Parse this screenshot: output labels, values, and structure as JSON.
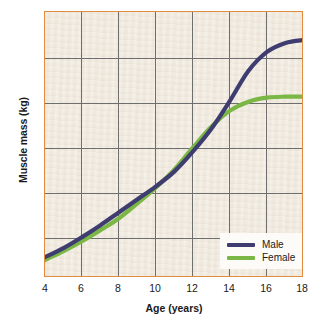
{
  "chart_data": {
    "type": "line",
    "title": "",
    "xlabel": "Age (years)",
    "ylabel": "Muscle mass (kg)",
    "xlim": [
      4,
      18
    ],
    "ylim": [
      1.5,
      28.2
    ],
    "xticks": [
      4,
      6,
      8,
      10,
      12,
      14,
      16,
      18
    ],
    "yticks": [
      5,
      10,
      15,
      20,
      25
    ],
    "grid": true,
    "legend_position": "lower-right",
    "x": [
      4,
      5,
      6,
      7,
      8,
      9,
      10,
      11,
      12,
      13,
      14,
      15,
      16,
      17,
      18
    ],
    "series": [
      {
        "name": "Male",
        "color": "#3f3c70",
        "values": [
          3.6,
          4.5,
          5.6,
          6.8,
          8.1,
          9.4,
          10.7,
          12.2,
          14.2,
          16.5,
          19.3,
          22.3,
          24.2,
          25.1,
          25.4
        ]
      },
      {
        "name": "Female",
        "color": "#7bb745",
        "values": [
          3.3,
          4.2,
          5.2,
          6.3,
          7.5,
          9.0,
          10.6,
          12.4,
          14.6,
          16.7,
          18.3,
          19.2,
          19.6,
          19.7,
          19.7
        ]
      }
    ],
    "colors": {
      "plot_background": "#f2ece2",
      "plot_border": "#e08b3e",
      "gridline": "#6e6e6e",
      "text": "#1a1a1a",
      "legend_background": "#fdfbf7"
    }
  },
  "axes": {
    "ylabel": "Muscle mass (kg)",
    "xlabel": "Age (years)",
    "yticks": [
      "25",
      "20",
      "15",
      "10",
      "5"
    ],
    "xticks": [
      "4",
      "6",
      "8",
      "10",
      "12",
      "14",
      "16",
      "18"
    ]
  },
  "legend": {
    "items": [
      {
        "label": "Male",
        "color": "#3f3c70"
      },
      {
        "label": "Female",
        "color": "#7bb745"
      }
    ]
  }
}
